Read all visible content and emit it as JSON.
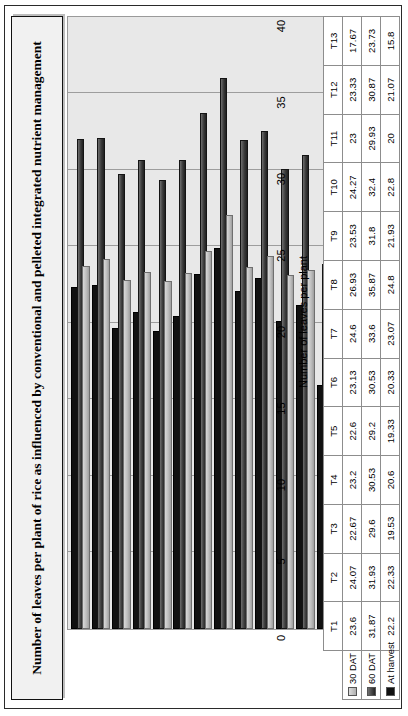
{
  "chart_data": {
    "type": "bar",
    "orientation": "vertical-rendered-rotated",
    "title": "Number of leaves per plant of rice as influenced by conventional and pelleted integrated nutrient management",
    "xlabel": "",
    "ylabel": "Number of leaves per plant",
    "ylim": [
      0,
      40
    ],
    "yticks": [
      0,
      5,
      10,
      15,
      20,
      25,
      30,
      35,
      40
    ],
    "grid": true,
    "legend_position": "table-left",
    "categories": [
      "T1",
      "T2",
      "T3",
      "T4",
      "T5",
      "T6",
      "T7",
      "T8",
      "T9",
      "T10",
      "T11",
      "T12",
      "T13"
    ],
    "series": [
      {
        "name": "30 DAT",
        "color": "#bdbdbd",
        "values": [
          23.6,
          24.07,
          22.67,
          23.2,
          22.6,
          23.13,
          24.6,
          26.93,
          23.53,
          24.27,
          23,
          23.33,
          17.67
        ],
        "labels": [
          "23.6",
          "24.07",
          "22.67",
          "23.2",
          "22.6",
          "23.13",
          "24.6",
          "26.93",
          "23.53",
          "24.27",
          "23",
          "23.33",
          "17.67"
        ]
      },
      {
        "name": "60 DAT",
        "color": "#3a3a3a",
        "values": [
          31.87,
          31.93,
          29.6,
          30.53,
          29.2,
          30.53,
          33.6,
          35.87,
          31.8,
          32.4,
          29.93,
          30.87,
          23.73
        ],
        "labels": [
          "31.87",
          "31.93",
          "29.6",
          "30.53",
          "29.2",
          "30.53",
          "33.6",
          "35.87",
          "31.8",
          "32.4",
          "29.93",
          "30.87",
          "23.73"
        ]
      },
      {
        "name": "At harvest",
        "color": "#111111",
        "values": [
          22.2,
          22.33,
          19.53,
          20.6,
          19.33,
          20.33,
          23.07,
          24.8,
          21.93,
          22.8,
          20,
          21.07,
          15.8
        ],
        "labels": [
          "22.2",
          "22.33",
          "19.53",
          "20.6",
          "19.33",
          "20.33",
          "23.07",
          "24.8",
          "21.93",
          "22.8",
          "20",
          "21.07",
          "15.8"
        ]
      }
    ]
  },
  "icons": {
    "legend_swatch_30": "square-swatch-icon",
    "legend_swatch_60": "square-swatch-icon",
    "legend_swatch_harvest": "square-swatch-icon"
  }
}
